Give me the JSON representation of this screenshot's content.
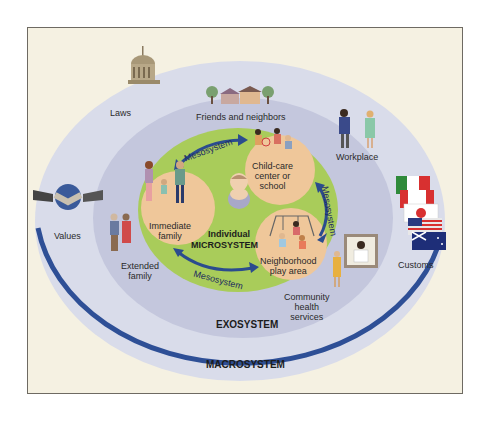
{
  "diagram": {
    "colors": {
      "frame_bg": "#f5f1e2",
      "macrosystem": "#d9dcea",
      "macro_border": "#2e4f96",
      "exosystem": "#c4c7dd",
      "microsystem": "#a9cc5a",
      "settings": "#efc79a",
      "arrow": "#2b4c8e"
    },
    "systems": {
      "individual": "Individual",
      "microsystem": "MICROSYSTEM",
      "exosystem": "EXOSYSTEM",
      "macrosystem": "MACROSYSTEM"
    },
    "microsystem_settings": {
      "immediate_family": [
        "Immediate",
        "family"
      ],
      "childcare": [
        "Child-care",
        "center or",
        "school"
      ],
      "neighborhood": [
        "Neighborhood",
        "play area"
      ]
    },
    "mesosystem_label": "Mesosystem",
    "exosystem_items": {
      "friends": "Friends and neighbors",
      "workplace": "Workplace",
      "extended_family": [
        "Extended",
        "family"
      ],
      "community_health": [
        "Community",
        "health",
        "services"
      ]
    },
    "macrosystem_items": {
      "laws": "Laws",
      "values": "Values",
      "customs": "Customs"
    },
    "icons": [
      "capitol-building-icon",
      "houses-icon",
      "handshake-globe-icon",
      "flags-icon",
      "workers-icon",
      "baby-icon",
      "family-icon",
      "playground-icon",
      "doctor-icon"
    ]
  }
}
